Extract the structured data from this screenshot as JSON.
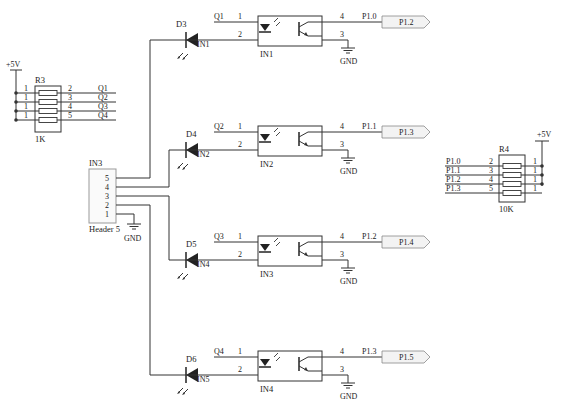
{
  "r3": {
    "ref": "R3",
    "value": "1K",
    "supply": "+5V",
    "left_pins": [
      "1",
      "1",
      "1",
      "1"
    ],
    "right_pins": [
      "2",
      "3",
      "4",
      "5"
    ],
    "nets": [
      "Q1",
      "Q2",
      "Q3",
      "Q4"
    ]
  },
  "r4": {
    "ref": "R4",
    "value": "10K",
    "supply": "+5V",
    "left_pins": [
      "2",
      "3",
      "4",
      "5"
    ],
    "right_pins": [
      "1",
      "1",
      "1",
      "1"
    ],
    "nets": [
      "P1.0",
      "P1.1",
      "P1.2",
      "P1.3"
    ]
  },
  "header": {
    "ref": "IN3",
    "name": "Header 5",
    "pins": [
      "5",
      "4",
      "3",
      "2",
      "1"
    ],
    "gnd": "GND"
  },
  "channels": [
    {
      "diode": "D3",
      "diode_net": "IN1",
      "opto": "IN1",
      "in_net": "Q1",
      "out_net": "P1.0",
      "port": "P1.2",
      "pin1": "1",
      "pin2": "2",
      "pin3": "3",
      "pin4": "4",
      "gnd": "GND"
    },
    {
      "diode": "D4",
      "diode_net": "IN2",
      "opto": "IN2",
      "in_net": "Q2",
      "out_net": "P1.1",
      "port": "P1.3",
      "pin1": "1",
      "pin2": "2",
      "pin3": "3",
      "pin4": "4",
      "gnd": "GND"
    },
    {
      "diode": "D5",
      "diode_net": "IN4",
      "opto": "IN3",
      "in_net": "Q3",
      "out_net": "P1.2",
      "port": "P1.4",
      "pin1": "1",
      "pin2": "2",
      "pin3": "3",
      "pin4": "4",
      "gnd": "GND"
    },
    {
      "diode": "D6",
      "diode_net": "IN5",
      "opto": "IN4",
      "in_net": "Q4",
      "out_net": "P1.3",
      "port": "P1.5",
      "pin1": "1",
      "pin2": "2",
      "pin3": "3",
      "pin4": "4",
      "gnd": "GND"
    }
  ]
}
